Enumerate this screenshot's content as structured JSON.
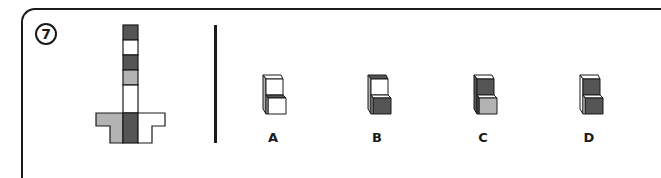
{
  "question": {
    "number": "7",
    "type": "cube net folding",
    "net": {
      "column_segments_top_to_bottom": [
        "dark",
        "white",
        "dark",
        "light-gray",
        "white"
      ],
      "base_row": {
        "left": "light-gray",
        "center": "dark",
        "right": "white"
      }
    },
    "options": [
      {
        "label": "A",
        "faces": {
          "upper_top": "white",
          "upper_front": "white",
          "left_side": "light-gray",
          "lower_top": "dark",
          "lower_front": "white"
        }
      },
      {
        "label": "B",
        "faces": {
          "upper_top": "dark",
          "upper_front": "white",
          "left_side": "light-gray",
          "lower_top": "white",
          "lower_front": "dark"
        }
      },
      {
        "label": "C",
        "faces": {
          "upper_top": "white",
          "upper_front": "dark",
          "left_side": "dark",
          "lower_top": "white",
          "lower_front": "light-gray"
        }
      },
      {
        "label": "D",
        "faces": {
          "upper_top": "white",
          "upper_front": "dark",
          "left_side": "white",
          "lower_top": "white",
          "lower_front": "dark"
        }
      }
    ]
  },
  "colors": {
    "dark": "#555555",
    "light-gray": "#b3b3b3",
    "white": "#ffffff",
    "stroke": "#1a1a1a"
  }
}
